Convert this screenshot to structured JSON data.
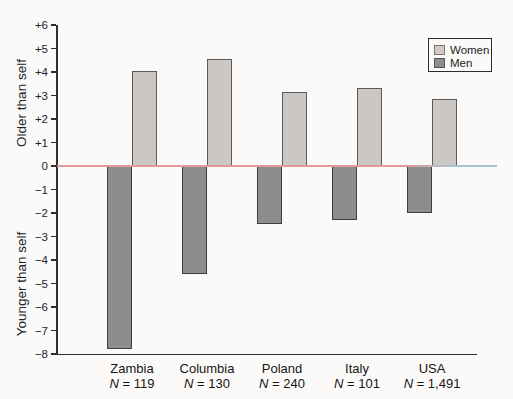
{
  "chart_data": {
    "type": "bar",
    "title": "",
    "categories": [
      "Zambia",
      "Columbia",
      "Poland",
      "Italy",
      "USA"
    ],
    "sample_sizes": [
      "N = 119",
      "N = 130",
      "N = 240",
      "N = 101",
      "N = 1,491"
    ],
    "series": [
      {
        "name": "Women",
        "color": "#cac7c4",
        "legend_color": "#d5c8c4",
        "border": "#5a5a5a",
        "values": [
          4.05,
          4.55,
          3.15,
          3.3,
          2.85
        ]
      },
      {
        "name": "Men",
        "color": "#8d8d8d",
        "legend_color": "#8d8d8d",
        "border": "#3e3e3e",
        "values": [
          -7.8,
          -4.6,
          -2.45,
          -2.3,
          -2.0
        ]
      }
    ],
    "ylabel_positive": "Older than self",
    "ylabel_negative": "Younger than self",
    "ylim": [
      -8,
      6
    ],
    "y_ticks": [
      "+6",
      "+5",
      "+4",
      "+3",
      "+2",
      "+1",
      "0",
      "−1",
      "−2",
      "−3",
      "−4",
      "−5",
      "−6",
      "−7",
      "−8"
    ],
    "legend_position": "top-right",
    "grid": false,
    "zero_line_color": "#e09a97",
    "zero_line_tail_color": "#a6c5d1",
    "axis_color": "#2f2f2f"
  }
}
